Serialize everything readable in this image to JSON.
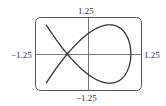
{
  "chart_data": {
    "type": "line",
    "title": "",
    "xlabel": "",
    "ylabel": "",
    "xlim": [
      -1.25,
      1.25
    ],
    "ylim": [
      -1.25,
      1.25
    ],
    "grid": false,
    "legend": null,
    "tick_labels": {
      "top": "1.25",
      "bottom": "−1.25",
      "left": "−1.25",
      "right": "1.25"
    },
    "series": [
      {
        "name": "nodal curve y^2 = 2(1 - x)(x + 0.5)^2",
        "description": "Closed loop on the right with a self-intersection node at (-0.5, 0); two branches continue to (-1, 1) and (-1, -1)",
        "x": [
          -1.0,
          -0.75,
          -0.5,
          -0.25,
          0.0,
          0.25,
          0.5,
          0.75,
          1.0
        ],
        "y_upper": [
          1.0,
          0.47,
          0.0,
          0.47,
          0.71,
          0.92,
          1.0,
          0.88,
          0.0
        ],
        "y_lower": [
          -1.0,
          -0.47,
          0.0,
          -0.47,
          -0.71,
          -0.92,
          -1.0,
          -0.88,
          0.0
        ]
      }
    ]
  }
}
